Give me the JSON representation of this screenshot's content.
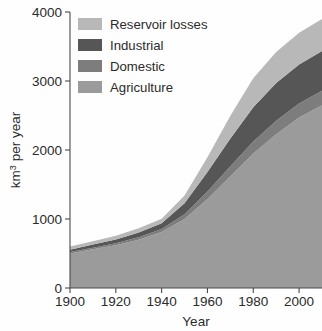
{
  "chart_data": {
    "type": "area",
    "stacked": true,
    "title": "",
    "subtitle": "",
    "xlabel": "Year",
    "ylabel": "km3 per year",
    "ylabel_parts": {
      "base": "km",
      "exponent": "3",
      "rest": " per year"
    },
    "xlim": [
      1900,
      2010
    ],
    "ylim": [
      0,
      4000
    ],
    "xticks": [
      1900,
      1920,
      1940,
      1960,
      1980,
      2000
    ],
    "xtick_labels": [
      "1900",
      "1920",
      "1940",
      "1960",
      "1980",
      "2000"
    ],
    "yticks": [
      0,
      1000,
      2000,
      3000,
      4000
    ],
    "ytick_labels": [
      "0",
      "1000",
      "2000",
      "3000",
      "4000"
    ],
    "grid": false,
    "legend_position": "upper-left-inside",
    "x": [
      1900,
      1910,
      1920,
      1930,
      1940,
      1950,
      1960,
      1970,
      1980,
      1990,
      2000,
      2010
    ],
    "series": [
      {
        "name": "Agriculture",
        "color": "#9b9b9b",
        "values": [
          500,
          560,
          620,
          700,
          810,
          1000,
          1290,
          1620,
          1950,
          2230,
          2470,
          2650
        ]
      },
      {
        "name": "Domestic",
        "color": "#7d7d7d",
        "values": [
          20,
          24,
          28,
          35,
          45,
          70,
          110,
          145,
          175,
          195,
          205,
          210
        ]
      },
      {
        "name": "Industrial",
        "color": "#565656",
        "values": [
          35,
          45,
          55,
          70,
          85,
          160,
          280,
          400,
          495,
          545,
          565,
          575
        ]
      },
      {
        "name": "Reservoir losses",
        "color": "#b8b8b8",
        "values": [
          45,
          50,
          55,
          60,
          65,
          110,
          215,
          330,
          420,
          450,
          460,
          465
        ]
      }
    ],
    "series_order_bottom_to_top": [
      "Agriculture",
      "Domestic",
      "Industrial",
      "Reservoir losses"
    ],
    "totals": [
      600,
      679,
      758,
      865,
      1005,
      1340,
      1895,
      2495,
      3040,
      3420,
      3700,
      3900
    ],
    "annotations": []
  },
  "legend": {
    "items": [
      {
        "label": "Reservoir losses",
        "color": "#b8b8b8"
      },
      {
        "label": "Industrial",
        "color": "#565656"
      },
      {
        "label": "Domestic",
        "color": "#7d7d7d"
      },
      {
        "label": "Agriculture",
        "color": "#9b9b9b"
      }
    ]
  },
  "colors": {
    "background": "#fefefe",
    "axis": "#4a4a4a",
    "text": "#2b2b2b"
  }
}
